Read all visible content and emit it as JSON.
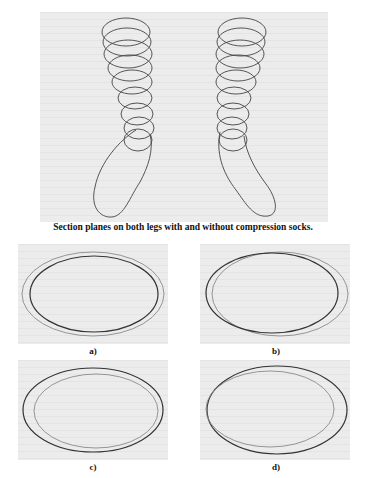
{
  "figure_top": {
    "caption": "Section planes on both legs with and without compression socks.",
    "legs": [
      "left-leg",
      "right-leg"
    ]
  },
  "figure_bottom": {
    "panels": [
      {
        "label": "a)"
      },
      {
        "label": "b)"
      },
      {
        "label": "c)"
      },
      {
        "label": "d)"
      }
    ]
  },
  "colors": {
    "panel_bg": "#ececec",
    "line_dark": "#333333",
    "line_light": "#8a8a8a"
  }
}
